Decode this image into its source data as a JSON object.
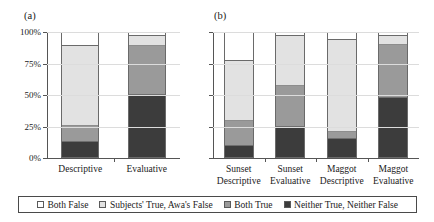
{
  "figure": {
    "background": "#ffffff",
    "panel_a_label": "(a)",
    "panel_b_label": "(b)"
  },
  "legend": {
    "position": "bottom-center",
    "items": [
      {
        "label": "Both False",
        "color": "#ffffff"
      },
      {
        "label": "Subjects' True, Awa's False",
        "color": "#e2e2e2"
      },
      {
        "label": "Both True",
        "color": "#9a9a9a"
      },
      {
        "label": "Neither True, Neither False",
        "color": "#3c3c3c"
      }
    ]
  },
  "axis": {
    "ticks": [
      {
        "value": 0,
        "label": "0%"
      },
      {
        "value": 25,
        "label": "25%"
      },
      {
        "value": 50,
        "label": "50%"
      },
      {
        "value": 75,
        "label": "75%"
      },
      {
        "value": 100,
        "label": "100%"
      }
    ],
    "ylim": [
      0,
      100
    ],
    "grid": true
  },
  "chart_data": [
    {
      "type": "bar",
      "title": "(a)",
      "stacked": true,
      "normalized": true,
      "xlabel": "",
      "ylabel": "",
      "ylim": [
        0,
        100
      ],
      "ytick_labels": [
        "0%",
        "25%",
        "50%",
        "75%",
        "100%"
      ],
      "grid": true,
      "legend_position": "bottom-center",
      "categories": [
        "Descriptive",
        "Evaluative"
      ],
      "series": [
        {
          "name": "Neither True, Neither False",
          "color": "#3c3c3c",
          "values": [
            12,
            51
          ]
        },
        {
          "name": "Both True",
          "color": "#9a9a9a",
          "values": [
            13,
            40
          ]
        },
        {
          "name": "Subjects' True, Awa's False",
          "color": "#e2e2e2",
          "values": [
            65,
            7
          ]
        },
        {
          "name": "Both False",
          "color": "#ffffff",
          "values": [
            10,
            2
          ]
        }
      ]
    },
    {
      "type": "bar",
      "title": "(b)",
      "stacked": true,
      "normalized": true,
      "xlabel": "",
      "ylabel": "",
      "ylim": [
        0,
        100
      ],
      "ytick_labels": [
        "0%",
        "25%",
        "50%",
        "75%",
        "100%"
      ],
      "grid": true,
      "legend_position": "bottom-center",
      "categories": [
        "Sunset\nDescriptive",
        "Sunset\nEvaluative",
        "Maggot\nDescriptive",
        "Maggot\nEvaluative"
      ],
      "series": [
        {
          "name": "Neither True, Neither False",
          "color": "#3c3c3c",
          "values": [
            9,
            25,
            15,
            49
          ]
        },
        {
          "name": "Both True",
          "color": "#9a9a9a",
          "values": [
            20,
            33,
            5,
            43
          ]
        },
        {
          "name": "Subjects' True, Awa's False",
          "color": "#e2e2e2",
          "values": [
            49,
            40,
            75,
            6
          ]
        },
        {
          "name": "Both False",
          "color": "#ffffff",
          "values": [
            22,
            2,
            5,
            2
          ]
        }
      ]
    }
  ]
}
